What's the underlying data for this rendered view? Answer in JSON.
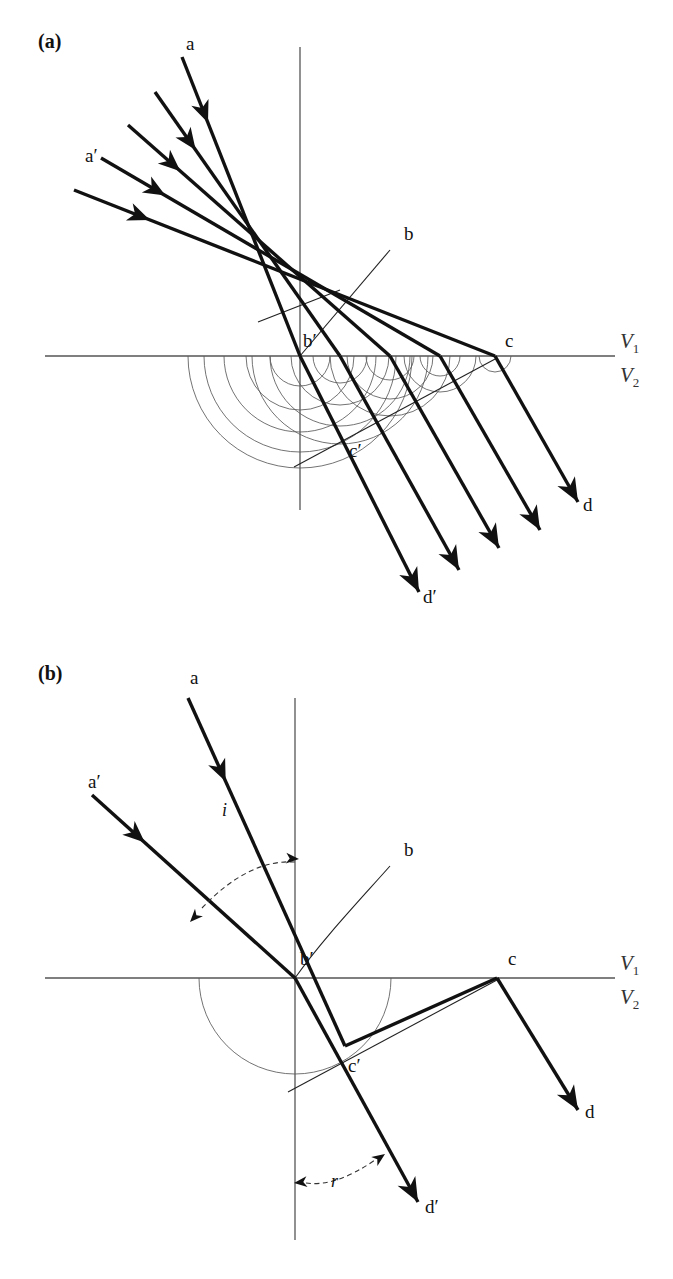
{
  "figure": {
    "width": 673,
    "height": 1279,
    "background": "#ffffff",
    "ink_color": "#111111",
    "axis_color": "#555555",
    "wavelet_color": "#5a5a5a"
  },
  "panels": [
    {
      "tag": "(a)",
      "tag_open": "(",
      "tag_letter": "a",
      "tag_close": ")",
      "description": "Multiple incident rays with Huygens secondary wavelets drawn as nested semicircles below the interface",
      "interface_label_upper": "V",
      "interface_label_upper_sub": "1",
      "interface_label_lower": "V",
      "interface_label_lower_sub": "2",
      "point_labels": [
        {
          "name": "ray-a-label",
          "text": "a",
          "x": 186,
          "y": 50,
          "prime": false
        },
        {
          "name": "ray-a-prime-label",
          "text": "a",
          "x": 85,
          "y": 162,
          "prime": true
        },
        {
          "name": "point-b-label",
          "text": "b",
          "x": 404,
          "y": 240,
          "prime": false
        },
        {
          "name": "point-b-prime-label",
          "text": "b",
          "x": 303,
          "y": 347,
          "prime": true
        },
        {
          "name": "point-c-label",
          "text": "c",
          "x": 505,
          "y": 347,
          "prime": false
        },
        {
          "name": "point-c-prime-label",
          "text": "c",
          "x": 349,
          "y": 457,
          "prime": true
        },
        {
          "name": "ray-d-label",
          "text": "d",
          "x": 583,
          "y": 511,
          "prime": false
        },
        {
          "name": "ray-d-prime-label",
          "text": "d",
          "x": 423,
          "y": 603,
          "prime": true
        }
      ],
      "angle_markers": []
    },
    {
      "tag": "(b)",
      "tag_open": "(",
      "tag_letter": "b",
      "tag_close": ")",
      "description": "Single incident ray pair showing angle of incidence i and angle of refraction r with one Huygens semicircle",
      "interface_label_upper": "V",
      "interface_label_upper_sub": "1",
      "interface_label_lower": "V",
      "interface_label_lower_sub": "2",
      "point_labels": [
        {
          "name": "ray-a-label",
          "text": "a",
          "x": 190,
          "y": 44,
          "prime": false
        },
        {
          "name": "ray-a-prime-label",
          "text": "a",
          "x": 88,
          "y": 148,
          "prime": true
        },
        {
          "name": "point-b-label",
          "text": "b",
          "x": 404,
          "y": 216,
          "prime": false
        },
        {
          "name": "point-b-prime-label",
          "text": "b",
          "x": 300,
          "y": 325,
          "prime": true
        },
        {
          "name": "point-c-label",
          "text": "c",
          "x": 508,
          "y": 325,
          "prime": false
        },
        {
          "name": "point-c-prime-label",
          "text": "c",
          "x": 348,
          "y": 432,
          "prime": true
        },
        {
          "name": "ray-d-label",
          "text": "d",
          "x": 585,
          "y": 478,
          "prime": false
        },
        {
          "name": "ray-d-prime-label",
          "text": "d",
          "x": 425,
          "y": 573,
          "prime": true
        }
      ],
      "angle_markers": [
        {
          "name": "angle-of-incidence",
          "symbol": "i",
          "label_x": 224,
          "label_y": 815,
          "absolute": true
        },
        {
          "name": "angle-of-refraction",
          "symbol": "r",
          "label_x": 288,
          "label_y": 1186,
          "absolute": true
        }
      ]
    }
  ],
  "geometry": {
    "panel_a": {
      "interface_y": 356,
      "interface_x1": 45,
      "interface_x2": 615,
      "vaxis_x": 300,
      "vaxis_y1": 47,
      "vaxis_y2": 510,
      "incident_rays": [
        {
          "x1": 182,
          "y1": 57,
          "x2": 300,
          "y2": 356
        },
        {
          "x1": 155,
          "y1": 92,
          "x2": 340,
          "y2": 356
        },
        {
          "x1": 128,
          "y1": 125,
          "x2": 390,
          "y2": 356
        },
        {
          "x1": 101,
          "y1": 158,
          "x2": 440,
          "y2": 356
        },
        {
          "x1": 74,
          "y1": 190,
          "x2": 495,
          "y2": 356
        }
      ],
      "incident_arrow_t": [
        0.22,
        0.22,
        0.2,
        0.19,
        0.18
      ],
      "refracted_rays": [
        {
          "x1": 300,
          "y1": 356,
          "x2": 419,
          "y2": 592
        },
        {
          "x1": 340,
          "y1": 356,
          "x2": 459,
          "y2": 570
        },
        {
          "x1": 390,
          "y1": 356,
          "x2": 499,
          "y2": 548
        },
        {
          "x1": 440,
          "y1": 356,
          "x2": 540,
          "y2": 530
        },
        {
          "x1": 495,
          "y1": 356,
          "x2": 578,
          "y2": 502
        }
      ],
      "wavefront_bb": {
        "x1": 390,
        "y1": 250,
        "x2": 300,
        "y2": 356
      },
      "wavefront_bb_extra": {
        "x1": 340,
        "y1": 290,
        "x2": 258,
        "y2": 322
      },
      "wavefront_cc": {
        "x1": 497,
        "y1": 358,
        "x2": 294,
        "y2": 467
      },
      "wavelet_centers": [
        300,
        340,
        390,
        440,
        495
      ],
      "wavelet_radii": [
        [
          30,
          54,
          76,
          96,
          112
        ],
        [
          27,
          49,
          70,
          88
        ],
        [
          24,
          43,
          60
        ],
        [
          20,
          36
        ],
        [
          16
        ]
      ]
    },
    "panel_b": {
      "interface_y": 338,
      "interface_x1": 45,
      "interface_x2": 615,
      "vaxis_x": 295,
      "vaxis_y1": 58,
      "vaxis_y2": 600,
      "incident_rays": [
        {
          "x1": 188,
          "y1": 58,
          "x2": 345,
          "y2": 406
        },
        {
          "x1": 92,
          "y1": 155,
          "x2": 295,
          "y2": 338
        }
      ],
      "incident_arrow_t": [
        0.24,
        0.26
      ],
      "refracted_rays": [
        {
          "x1": 497,
          "y1": 338,
          "x2": 578,
          "y2": 470
        },
        {
          "x1": 295,
          "y1": 338,
          "x2": 418,
          "y2": 562
        }
      ],
      "ray_a_continues": {
        "x1": 345,
        "y1": 406,
        "x2": 497,
        "y2": 338
      },
      "wavefront_bb": {
        "x1": 390,
        "y1": 226,
        "x2": 295,
        "y2": 338
      },
      "wavefront_cc": {
        "x1": 497,
        "y1": 340,
        "x2": 288,
        "y2": 452
      },
      "huygens_circle": {
        "cx": 295,
        "cy": 338,
        "r": 96
      },
      "angle_i_arc": {
        "x1": 202,
        "y1": 268,
        "x2": 295,
        "y2": 222,
        "bow": 26
      },
      "angle_r_arc": {
        "x1": 295,
        "y1": 543,
        "x2": 375,
        "y2": 520,
        "bow": -16
      }
    }
  }
}
